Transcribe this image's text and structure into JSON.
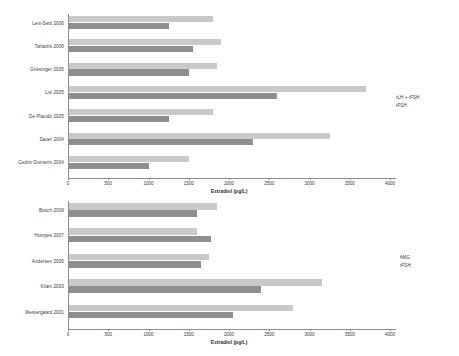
{
  "chart_data": [
    {
      "id": "top",
      "type": "bar",
      "orientation": "horizontal",
      "title": "",
      "xlabel": "Estradiol (pg/L)",
      "ylabel": "",
      "xlim": [
        0,
        4000
      ],
      "xticks": [
        "0",
        "500",
        "1000",
        "1500",
        "2000",
        "2500",
        "3000",
        "3500",
        "4000"
      ],
      "xtick_values": [
        0,
        500,
        1000,
        1500,
        2000,
        2500,
        3000,
        3500,
        4000
      ],
      "grid": false,
      "legend_position": "right",
      "categories": [
        "Levi-Setti 2006",
        "Tarlatzis 2006",
        "Griesinger 2005",
        "Lisi 2005",
        "De Placido 2005",
        "Sauer 2004",
        "Cedrin-Durnerin 2004"
      ],
      "series": [
        {
          "name": "rLH + rFSH",
          "color": "#c9c9c9",
          "values": [
            1800,
            1900,
            1850,
            3700,
            1800,
            3250,
            1500
          ]
        },
        {
          "name": "rFSH",
          "color": "#8e8e8e",
          "values": [
            1250,
            1550,
            1500,
            2600,
            1250,
            2300,
            1000
          ]
        }
      ]
    },
    {
      "id": "bottom",
      "type": "bar",
      "orientation": "horizontal",
      "title": "",
      "xlabel": "Estradiol (pg/L)",
      "ylabel": "",
      "xlim": [
        0,
        4000
      ],
      "xticks": [
        "0",
        "500",
        "1000",
        "1500",
        "2000",
        "2500",
        "3000",
        "3500",
        "4000"
      ],
      "xtick_values": [
        0,
        500,
        1000,
        1500,
        2000,
        2500,
        3000,
        3500,
        4000
      ],
      "grid": false,
      "legend_position": "right",
      "categories": [
        "Bosch 2008",
        "Hompes 2007",
        "Andersen 2006",
        "Kilani 2003",
        "Westergaard 2001"
      ],
      "series": [
        {
          "name": "hMG",
          "color": "#c9c9c9",
          "values": [
            1850,
            1600,
            1750,
            3150,
            2800
          ]
        },
        {
          "name": "rFSH",
          "color": "#8e8e8e",
          "values": [
            1600,
            1780,
            1650,
            2400,
            2050
          ]
        }
      ]
    }
  ],
  "figure": {
    "background": "#ffffff",
    "bar_light_color": "#c9c9c9",
    "bar_dark_color": "#8e8e8e",
    "axis_color": "#8d8d8d"
  }
}
